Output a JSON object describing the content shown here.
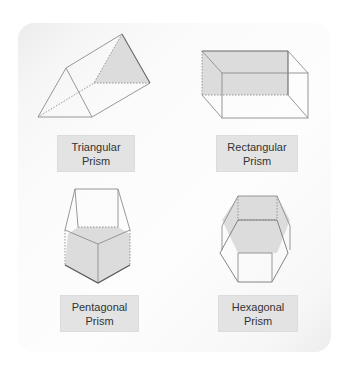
{
  "figure": {
    "title": "",
    "colors": {
      "face_fill": "#dcdcdc",
      "edge": "#8a8a8a",
      "hidden_edge": "#8a8a8a",
      "label_bg": "#e3e3e3",
      "label_text": "#333333"
    }
  },
  "shapes": [
    {
      "id": "triangular",
      "label_line1": "Triangular",
      "label_line2": "Prism"
    },
    {
      "id": "rectangular",
      "label_line1": "Rectangular",
      "label_line2": "Prism"
    },
    {
      "id": "pentagonal",
      "label_line1": "Pentagonal",
      "label_line2": "Prism"
    },
    {
      "id": "hexagonal",
      "label_line1": "Hexagonal",
      "label_line2": "Prism"
    }
  ]
}
